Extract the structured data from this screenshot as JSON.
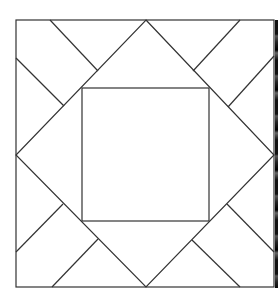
{
  "diagram": {
    "title": "",
    "stroke_color": "#333333",
    "background_color": "#ffffff",
    "stroke_width": 1.2,
    "outer_square": {
      "x": 16,
      "y": 20,
      "width": 258,
      "height": 267
    },
    "diamond": [
      [
        146,
        20
      ],
      [
        274,
        155
      ],
      [
        146,
        287
      ],
      [
        16,
        155
      ]
    ],
    "inner_square": {
      "x": 82,
      "y": 88,
      "width": 127,
      "height": 133
    },
    "corner_lines": [
      {
        "id": "tl-top",
        "x1": 50,
        "y1": 20,
        "x2": 98,
        "y2": 71
      },
      {
        "id": "tl-left",
        "x1": 16,
        "y1": 58,
        "x2": 64,
        "y2": 106
      },
      {
        "id": "tr-top",
        "x1": 240,
        "y1": 20,
        "x2": 193,
        "y2": 71
      },
      {
        "id": "tr-right",
        "x1": 274,
        "y1": 56,
        "x2": 228,
        "y2": 107
      },
      {
        "id": "bl-left",
        "x1": 16,
        "y1": 252,
        "x2": 63,
        "y2": 204
      },
      {
        "id": "bl-bottom",
        "x1": 52,
        "y1": 287,
        "x2": 98,
        "y2": 239
      },
      {
        "id": "br-right",
        "x1": 274,
        "y1": 252,
        "x2": 227,
        "y2": 204
      },
      {
        "id": "br-bottom",
        "x1": 240,
        "y1": 287,
        "x2": 192,
        "y2": 240
      }
    ]
  }
}
